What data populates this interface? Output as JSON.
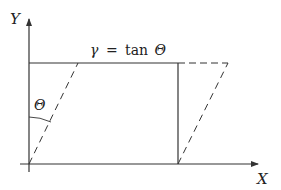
{
  "diagram": {
    "type": "shear-deformation",
    "axes": {
      "x_label": "X",
      "y_label": "Y"
    },
    "equation": {
      "lhs": "γ",
      "op": "=",
      "rhs_fn": "tan",
      "rhs_arg": "Θ"
    },
    "angle_label": "Θ",
    "colors": {
      "line": "#333333",
      "text": "#222222",
      "background": "#ffffff"
    },
    "shapes": {
      "original_rectangle": "solid",
      "sheared_parallelogram": "dashed"
    }
  }
}
